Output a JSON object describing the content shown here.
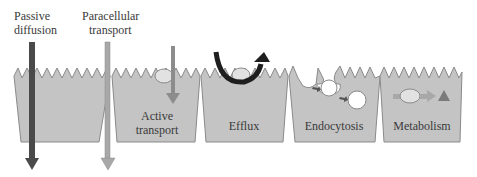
{
  "labels": {
    "passive_diffusion_line1": "Passive",
    "passive_diffusion_line2": "diffusion",
    "paracellular_line1": "Paracellular",
    "paracellular_line2": "transport"
  },
  "cells": [
    {
      "name": "passive",
      "label": ""
    },
    {
      "name": "active-transport",
      "label_line1": "Active",
      "label_line2": "transport"
    },
    {
      "name": "efflux",
      "label": "Efflux"
    },
    {
      "name": "endocytosis",
      "label": "Endocytosis"
    },
    {
      "name": "metabolism",
      "label": "Metabolism"
    }
  ],
  "colors": {
    "cell_fill": "#c4c4c4",
    "cell_stroke": "#8a8a8a",
    "passive_arrow": "#4a4a4a",
    "paracellular_arrow": "#a8a8a8",
    "active_arrow": "#8c8c8c",
    "efflux_arrow": "#1e1e1e",
    "vesicle": "#ffffff",
    "carrier": "#e2e2e2",
    "text": "#3a3a3a"
  }
}
